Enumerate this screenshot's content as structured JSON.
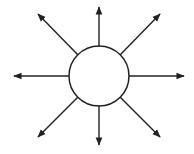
{
  "diagram": {
    "type": "radial-arrows",
    "center": {
      "x": 99,
      "y": 76
    },
    "radius": 30,
    "stroke_color": "#222222",
    "fill_color": "#ffffff",
    "arrows": [
      {
        "direction": "north",
        "x1": 99,
        "y1": 46,
        "x2": 99,
        "y2": 7
      },
      {
        "direction": "north-east",
        "x1": 120,
        "y1": 55,
        "x2": 160,
        "y2": 14
      },
      {
        "direction": "east",
        "x1": 129,
        "y1": 76,
        "x2": 184,
        "y2": 76
      },
      {
        "direction": "south-east",
        "x1": 120,
        "y1": 97,
        "x2": 160,
        "y2": 137
      },
      {
        "direction": "south",
        "x1": 99,
        "y1": 106,
        "x2": 99,
        "y2": 145
      },
      {
        "direction": "south-west",
        "x1": 78,
        "y1": 97,
        "x2": 38,
        "y2": 137
      },
      {
        "direction": "west",
        "x1": 69,
        "y1": 76,
        "x2": 14,
        "y2": 76
      },
      {
        "direction": "north-west",
        "x1": 78,
        "y1": 55,
        "x2": 38,
        "y2": 14
      }
    ]
  }
}
